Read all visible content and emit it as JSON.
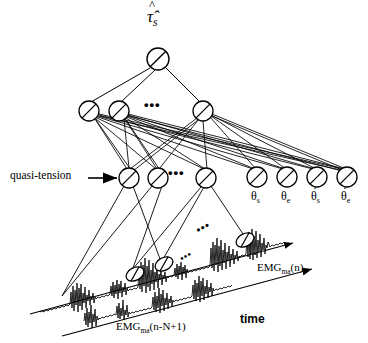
{
  "figure": {
    "type": "diagram",
    "width": 368,
    "height": 343,
    "stroke_color": "#000000",
    "background_color": "#ffffff"
  },
  "labels": {
    "output_node": "τ̂",
    "output_node_sub": "s",
    "quasi_tension": "quasi-tension",
    "time": "time",
    "emg_right_base": "EMG",
    "emg_right_sub": "ma",
    "emg_right_arg": "(n)",
    "emg_left_base": "EMG",
    "emg_left_sub": "ma",
    "emg_left_arg": "(n-N+1)",
    "ellipsis": "•••"
  },
  "angle_inputs": [
    {
      "base": "θ",
      "sub": "s",
      "dot": false
    },
    {
      "base": "θ",
      "sub": "e",
      "dot": false
    },
    {
      "base": "θ",
      "sub": "s",
      "dot": true
    },
    {
      "base": "θ",
      "sub": "e",
      "dot": true
    }
  ],
  "nodes": {
    "output": [
      {
        "cx": 158,
        "cy": 59,
        "r": 11
      }
    ],
    "hidden": [
      {
        "cx": 89,
        "cy": 111,
        "r": 10
      },
      {
        "cx": 119,
        "cy": 111,
        "r": 10
      },
      {
        "cx": 203,
        "cy": 111,
        "r": 10
      }
    ],
    "tension": [
      {
        "cx": 129,
        "cy": 178,
        "r": 10
      },
      {
        "cx": 158,
        "cy": 178,
        "r": 10
      },
      {
        "cx": 206,
        "cy": 178,
        "r": 10
      }
    ],
    "angles": [
      {
        "cx": 257,
        "cy": 177,
        "r": 10
      },
      {
        "cx": 287,
        "cy": 177,
        "r": 10
      },
      {
        "cx": 317,
        "cy": 177,
        "r": 10
      },
      {
        "cx": 347,
        "cy": 177,
        "r": 10
      }
    ],
    "emg_taps": [
      {
        "cx": 135,
        "cy": 274,
        "rx": 9,
        "ry": 6,
        "rot": -28
      },
      {
        "cx": 165,
        "cy": 265,
        "rx": 9,
        "ry": 6,
        "rot": -28
      },
      {
        "cx": 245,
        "cy": 240,
        "rx": 9,
        "ry": 6,
        "rot": -28
      }
    ]
  },
  "ellipses_text": [
    {
      "x": 152,
      "y": 104,
      "name": "hidden-layer-ellipsis"
    },
    {
      "x": 176,
      "y": 172,
      "name": "tension-layer-ellipsis"
    },
    {
      "x": 202,
      "y": 228,
      "name": "emg-upper-ellipsis"
    },
    {
      "x": 184,
      "y": 256,
      "name": "emg-lower-ellipsis"
    }
  ]
}
